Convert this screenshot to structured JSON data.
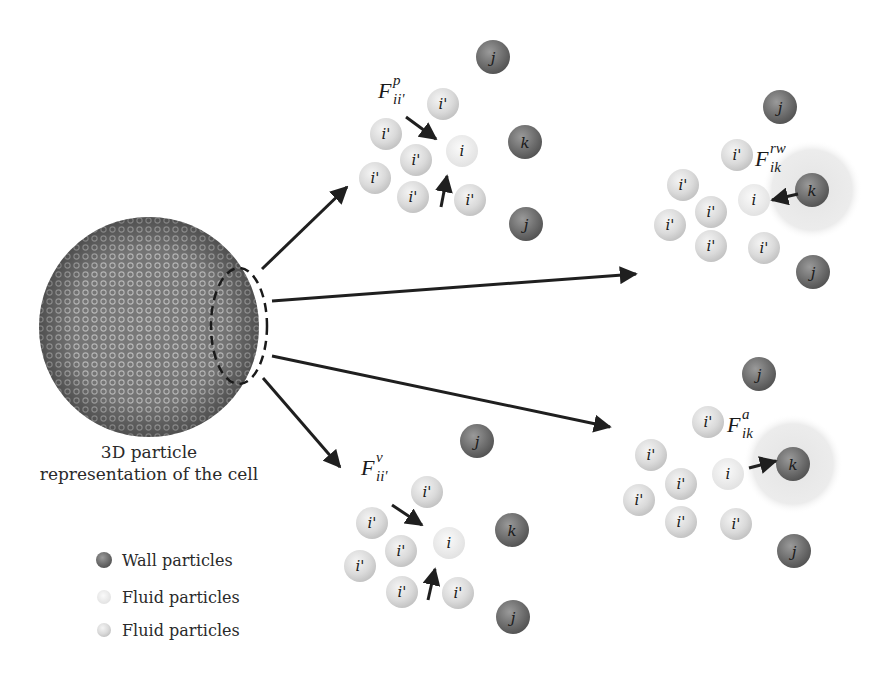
{
  "figure": {
    "cell_caption": [
      "3D particle",
      "representation of the cell"
    ],
    "legend": [
      {
        "label": "Wall particles",
        "kind": "wall"
      },
      {
        "label": "Fluid particles",
        "kind": "fluid-light"
      },
      {
        "label": "Fluid particles",
        "kind": "fluid"
      }
    ],
    "colors": {
      "wall": "#6f6f6f",
      "fluid": "#dcdcdc",
      "fluid_center": "#eeeeee",
      "arrow": "#1f1f1f",
      "halo": "#e6e6e6"
    },
    "panels": [
      {
        "id": "pressure",
        "force_symbol": "F",
        "force_sup": "p",
        "force_sub": "ii'",
        "labels": {
          "center": "i",
          "neighbor": "i'",
          "wall_j": "j",
          "wall_k": "k"
        }
      },
      {
        "id": "repulsive-wall",
        "force_symbol": "F",
        "force_sup": "rw",
        "force_sub": "ik",
        "labels": {
          "center": "i",
          "neighbor": "i'",
          "wall_j": "j",
          "wall_k": "k"
        }
      },
      {
        "id": "attractive",
        "force_symbol": "F",
        "force_sup": "a",
        "force_sub": "ik",
        "labels": {
          "center": "i",
          "neighbor": "i'",
          "wall_j": "j",
          "wall_k": "k"
        }
      },
      {
        "id": "viscous",
        "force_symbol": "F",
        "force_sup": "v",
        "force_sub": "ii'",
        "labels": {
          "center": "i",
          "neighbor": "i'",
          "wall_j": "j",
          "wall_k": "k"
        }
      }
    ]
  }
}
